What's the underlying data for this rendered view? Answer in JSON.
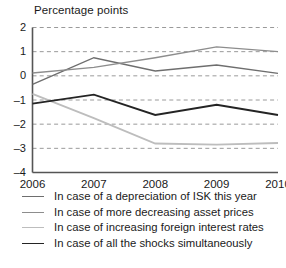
{
  "chart_data": {
    "type": "line",
    "title": "",
    "ylabel": "Percentage points",
    "xlabel": "",
    "categories": [
      "2006",
      "2007",
      "2008",
      "2009",
      "2010"
    ],
    "x": [
      2006,
      2007,
      2008,
      2009,
      2010
    ],
    "ylim": [
      -4,
      2
    ],
    "yticks": [
      2,
      1,
      0,
      -1,
      -2,
      -3,
      -4
    ],
    "ytick_labels": [
      "2",
      "1",
      "0",
      "–1",
      "–2",
      "–3",
      "–4"
    ],
    "grid": true,
    "grid_style": "dashed-horizontal",
    "legend_position": "below",
    "series": [
      {
        "name": "In case of a depreciation of ISK this year",
        "color": "#6e6e6e",
        "width": 1.4,
        "values": [
          -0.35,
          0.75,
          0.2,
          0.45,
          0.1
        ]
      },
      {
        "name": "In case of more decreasing asset prices",
        "color": "#8d8d8d",
        "width": 1.4,
        "values": [
          0.12,
          0.35,
          0.75,
          1.2,
          1.0
        ]
      },
      {
        "name": "In case of increasing foreign interest rates",
        "color": "#bdbdbd",
        "width": 1.8,
        "values": [
          -0.75,
          -1.75,
          -2.8,
          -2.85,
          -2.78
        ]
      },
      {
        "name": "In case of all the shocks simultaneously",
        "color": "#242424",
        "width": 1.9,
        "values": [
          -1.15,
          -0.78,
          -1.62,
          -1.2,
          -1.62
        ]
      }
    ]
  },
  "axes": {
    "spine_color": "#555555",
    "grid_color": "#9a9a9a"
  }
}
